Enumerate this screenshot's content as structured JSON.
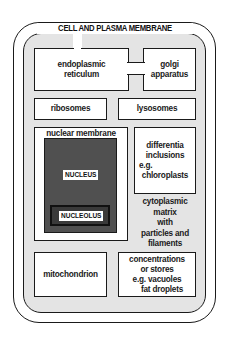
{
  "diagram": {
    "title": "CELL AND PLASMA MEMBRANE",
    "organelles": {
      "endoplasmic_reticulum": {
        "line1": "endoplasmic",
        "line2": "reticulum"
      },
      "golgi": {
        "line1": "golgi",
        "line2": "apparatus"
      },
      "ribosomes": "ribosomes",
      "lysosomes": "lysosomes",
      "nuclear_membrane": "nuclear membrane",
      "nucleus": "NUCLEUS",
      "nucleolus": "NUCLEOLUS",
      "differentia": {
        "line1": "differentia",
        "line2": "inclusions",
        "line3": "e.g.",
        "line4": "chloroplasts"
      },
      "cytoplasm": {
        "line1": "cytoplasmic",
        "line2": "matrix",
        "line3": "with",
        "line4": "particles and",
        "line5": "filaments"
      },
      "mitochondrion": "mitochondrion",
      "concentrations": {
        "line1": "concentrations",
        "line2": "or stores",
        "line3": "e.g. vacuoles",
        "line4": "fat droplets"
      }
    },
    "colors": {
      "outline": "#1a1a1a",
      "stipple": "#e4e4e4",
      "nucleus_fill": "#505050",
      "background": "#ffffff"
    }
  }
}
